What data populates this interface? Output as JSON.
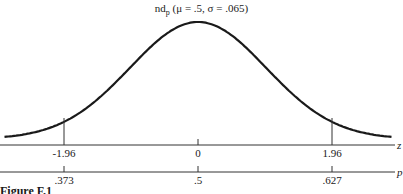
{
  "chart_data": {
    "type": "line",
    "title_parts": {
      "prefix": "nd",
      "subscript": "p",
      "params": " (μ = .5, σ = .065)"
    },
    "curve": {
      "distribution": "normal",
      "mean": 0.5,
      "sd": 0.065,
      "color": "#1a1a1a"
    },
    "axes": [
      {
        "name": "z",
        "ticks": [
          "-1.96",
          "0",
          "1.96"
        ],
        "values": [
          -1.96,
          0,
          1.96
        ]
      },
      {
        "name": "p",
        "ticks": [
          ".373",
          ".5",
          ".627"
        ],
        "values": [
          0.373,
          0.5,
          0.627
        ]
      }
    ],
    "markers": [
      {
        "z": -1.96,
        "p": 0.373
      },
      {
        "z": 0,
        "p": 0.5
      },
      {
        "z": 1.96,
        "p": 0.627
      }
    ],
    "grid": false,
    "legend": null
  },
  "caption": "Figure F.1"
}
